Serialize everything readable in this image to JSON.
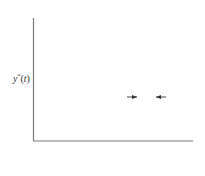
{
  "chart_data": {
    "type": "stem",
    "title": "",
    "xlabel": "t",
    "ylabel": "y*(t)",
    "y_zero_label": "0",
    "categories": [
      "0",
      "t1",
      "t2",
      "t3",
      "t4",
      "t5",
      "t6",
      "t7"
    ],
    "values": [
      0.47,
      0.61,
      0.8,
      0.91,
      0.86,
      0.75,
      0.73,
      0.73
    ],
    "annotation": "Δt",
    "annotation_between": [
      "t6",
      "t7"
    ],
    "grid": false,
    "legend": null
  },
  "labels": {
    "y_axis": "y*(t)",
    "y_zero": "0",
    "x_axis": "t",
    "delta": "Δt",
    "ticks": [
      {
        "base": "0",
        "sub": ""
      },
      {
        "base": "t",
        "sub": "1"
      },
      {
        "base": "t",
        "sub": "2"
      },
      {
        "base": "t",
        "sub": "3"
      },
      {
        "base": "t",
        "sub": "4"
      },
      {
        "base": "t",
        "sub": "5"
      },
      {
        "base": "t",
        "sub": "6"
      },
      {
        "base": "t",
        "sub": "7"
      }
    ]
  },
  "colors": {
    "axis": "#777777",
    "stem": "#333333",
    "dot": "#111111"
  }
}
